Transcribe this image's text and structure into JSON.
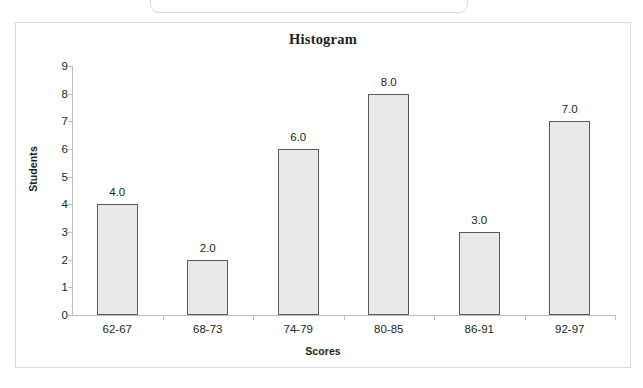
{
  "chart_data": {
    "type": "bar",
    "title": "Histogram",
    "xlabel": "Scores",
    "ylabel": "Students",
    "categories": [
      "62-67",
      "68-73",
      "74-79",
      "80-85",
      "86-91",
      "92-97"
    ],
    "values": [
      4,
      2,
      6,
      8,
      3,
      7
    ],
    "data_labels": [
      "4.0",
      "2.0",
      "6.0",
      "8.0",
      "3.0",
      "7.0"
    ],
    "ylim": [
      0,
      9
    ],
    "ytick_labels": [
      "9",
      "8",
      "7",
      "6",
      "5",
      "4",
      "3",
      "2",
      "1",
      "0"
    ],
    "ytick_values": [
      9,
      8,
      7,
      6,
      5,
      4,
      3,
      2,
      1,
      0
    ],
    "grid": false,
    "legend": "none",
    "bar_fill_color": "#e9e9e9",
    "bar_border_color": "#58595b",
    "axis_color": "#bcbec0",
    "text_color": "#231f20",
    "background_color": "#ffffff"
  }
}
